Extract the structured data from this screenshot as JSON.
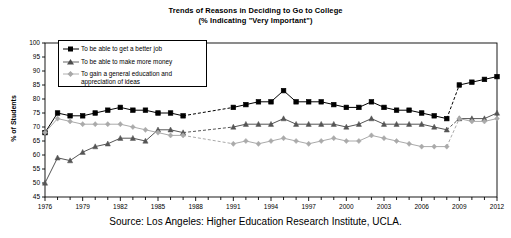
{
  "title": {
    "line1": "Trends of Reasons in Deciding to Go to College",
    "line2": "(% Indicating \"Very Important\")"
  },
  "axis": {
    "ylabel": "% of Students",
    "yticks": [
      "100",
      "95",
      "90",
      "85",
      "80",
      "75",
      "70",
      "65",
      "60",
      "55",
      "50",
      "45"
    ],
    "xticks": [
      "1976",
      "1979",
      "1982",
      "1985",
      "1988",
      "1991",
      "1994",
      "1997",
      "2000",
      "2003",
      "2006",
      "2009",
      "2012"
    ]
  },
  "legend": {
    "items": [
      {
        "label": "To be able to get a better job",
        "marker": "square-marker",
        "color": "#000000"
      },
      {
        "label": "To be able to make more money",
        "marker": "triangle-marker",
        "color": "#555555"
      },
      {
        "label": "To gain a general education and appreciation of ideas",
        "marker": "diamond-marker",
        "color": "#aaaaaa"
      }
    ]
  },
  "source": "Source: Los Angeles: Higher Education Research Institute, UCLA.",
  "chart_data": {
    "type": "line",
    "title": "Trends of Reasons in Deciding to Go to College (% Indicating \"Very Important\")",
    "xlabel": "",
    "ylabel": "% of Students",
    "ylim": [
      45,
      100
    ],
    "xlim": [
      1976,
      2012
    ],
    "grid": false,
    "legend_position": "upper-left",
    "x": [
      1976,
      1977,
      1978,
      1979,
      1980,
      1981,
      1982,
      1983,
      1984,
      1985,
      1986,
      1987,
      1988,
      1989,
      1990,
      1991,
      1992,
      1993,
      1994,
      1995,
      1996,
      1997,
      1998,
      1999,
      2000,
      2001,
      2002,
      2003,
      2004,
      2005,
      2006,
      2007,
      2008,
      2009,
      2010,
      2011,
      2012
    ],
    "series": [
      {
        "name": "To be able to get a better job",
        "marker": "square",
        "color": "#000000",
        "values": [
          68,
          75,
          74,
          74,
          75,
          76,
          77,
          76,
          76,
          75,
          75,
          74,
          null,
          null,
          null,
          77,
          78,
          79,
          79,
          83,
          79,
          79,
          79,
          78,
          77,
          77,
          79,
          77,
          76,
          76,
          75,
          74,
          73,
          null,
          null,
          null,
          null
        ]
      },
      {
        "name": "To be able to make more money",
        "marker": "triangle",
        "color": "#555555",
        "values": [
          50,
          59,
          58,
          61,
          63,
          64,
          66,
          66,
          65,
          69,
          69,
          68,
          null,
          null,
          null,
          70,
          71,
          71,
          71,
          73,
          71,
          71,
          71,
          71,
          70,
          71,
          73,
          71,
          71,
          71,
          71,
          70,
          69,
          null,
          null,
          null,
          null
        ]
      },
      {
        "name": "To gain a general education and appreciation of ideas",
        "marker": "diamond",
        "color": "#aaaaaa",
        "values": [
          68,
          73,
          72,
          71,
          71,
          71,
          71,
          70,
          69,
          68,
          67,
          67,
          null,
          null,
          null,
          64,
          65,
          64,
          65,
          66,
          65,
          64,
          65,
          66,
          65,
          65,
          67,
          66,
          65,
          64,
          63,
          63,
          63,
          null,
          null,
          null,
          null
        ]
      }
    ],
    "segments_dashed": [
      {
        "series": "To be able to get a better job",
        "from_x": 1987,
        "to_x": 1991
      },
      {
        "series": "To be able to get a better job",
        "from_x": 2008,
        "to_x": 2009
      },
      {
        "series": "To be able to make more money",
        "from_x": 1987,
        "to_x": 1991
      },
      {
        "series": "To be able to make more money",
        "from_x": 2008,
        "to_x": 2009
      },
      {
        "series": "To gain a general education and appreciation of ideas",
        "from_x": 1987,
        "to_x": 1991
      },
      {
        "series": "To gain a general education and appreciation of ideas",
        "from_x": 2008,
        "to_x": 2009
      }
    ],
    "tail_points": {
      "To be able to get a better job": {
        "2009": 85,
        "2010": 86,
        "2011": 87,
        "2012": 88
      },
      "To be able to make more money": {
        "2009": 73,
        "2010": 73,
        "2011": 73,
        "2012": 75
      },
      "To gain a general education and appreciation of ideas": {
        "2009": 73,
        "2010": 72,
        "2011": 72,
        "2012": 73
      }
    }
  }
}
